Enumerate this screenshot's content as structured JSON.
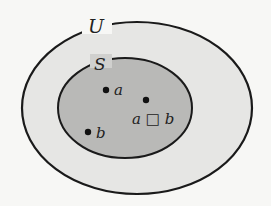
{
  "diagram": {
    "type": "venn",
    "universe": {
      "label": "U",
      "fill": "#e6e6e4",
      "stroke": "#1a1a1a"
    },
    "subset": {
      "label": "S",
      "fill": "#b9b9b7",
      "stroke": "#1a1a1a"
    },
    "points": [
      {
        "label": "a"
      },
      {
        "label": "b"
      },
      {
        "label": "a □ b"
      }
    ]
  }
}
